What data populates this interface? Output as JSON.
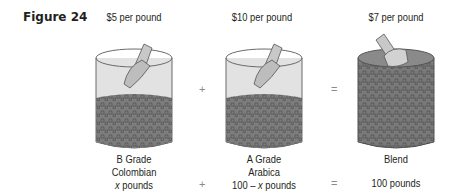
{
  "figure": {
    "label": "Figure 24"
  },
  "items": [
    {
      "price": "$5 per pound",
      "line1": "B Grade",
      "line2": "Colombian",
      "amount_var": "x",
      "amount_rest": " pounds"
    },
    {
      "price": "$10 per pound",
      "line1": "A Grade",
      "line2": "Arabica",
      "amount_prefix": "100 – ",
      "amount_var": "x",
      "amount_rest": " pounds"
    },
    {
      "price": "$7 per pound",
      "line1": "Blend",
      "amount": "100 pounds"
    }
  ],
  "operators": {
    "plus": "+",
    "equals": "="
  },
  "colors": {
    "glass": "#d9d9d9",
    "coffee": "#7a7a7a",
    "coffee_dark": "#5e5e5e",
    "scoop": "#bfbfbf"
  }
}
